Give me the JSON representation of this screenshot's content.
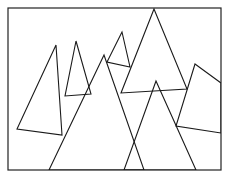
{
  "diagram": {
    "stroke_color": "#1a1a1a",
    "background": "#ffffff",
    "frame": {
      "x": 8,
      "y": 8,
      "width": 213,
      "height": 162
    },
    "shapes": [
      {
        "name": "triangle-left-tall",
        "points": [
          [
            56,
            45
          ],
          [
            17,
            129
          ],
          [
            62,
            135
          ]
        ]
      },
      {
        "name": "triangle-left-small",
        "points": [
          [
            76,
            41
          ],
          [
            65,
            96
          ],
          [
            91,
            94
          ]
        ]
      },
      {
        "name": "triangle-mid-small",
        "points": [
          [
            122,
            32
          ],
          [
            107,
            62
          ],
          [
            130,
            67
          ]
        ]
      },
      {
        "name": "triangle-large-left",
        "points": [
          [
            104,
            55
          ],
          [
            49,
            170
          ],
          [
            144,
            170
          ]
        ]
      },
      {
        "name": "triangle-large-top",
        "points": [
          [
            154,
            9
          ],
          [
            121,
            93
          ],
          [
            187,
            89
          ]
        ]
      },
      {
        "name": "triangle-lower-middle",
        "points": [
          [
            156,
            81
          ],
          [
            124,
            170
          ],
          [
            196,
            170
          ]
        ]
      },
      {
        "name": "quad-right",
        "points": [
          [
            195,
            64
          ],
          [
            221,
            83
          ],
          [
            221,
            133
          ],
          [
            176,
            126
          ]
        ]
      }
    ]
  }
}
